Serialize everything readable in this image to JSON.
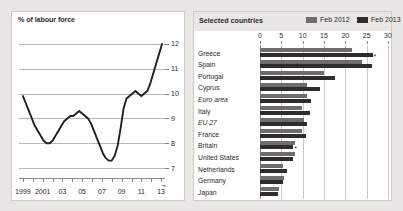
{
  "colors": {
    "background": "#e9e7e3",
    "panel": "#ffffff",
    "line": "#231f20",
    "bar_2012": "#6f6d69",
    "bar_2013": "#2f2d2b",
    "grid": "#b9b7b2",
    "text": "#2b2b2b"
  },
  "left_panel": {
    "title": "% of labour force"
  },
  "right_panel": {
    "title": "Selected countries",
    "legend": [
      {
        "label": "Feb 2012",
        "color": "#6f6d69"
      },
      {
        "label": "Feb 2013",
        "color": "#2f2d2b"
      }
    ]
  },
  "chart_data": [
    {
      "type": "line",
      "title": "% of labour force",
      "xlabel": "",
      "ylabel": "% of labour force",
      "ylim": [
        6.6,
        12.4
      ],
      "xlim": [
        1998.6,
        2013.4
      ],
      "grid": true,
      "legend_position": "none",
      "yticks": [
        7,
        8,
        9,
        10,
        11,
        12
      ],
      "ytick_labels": [
        "7",
        "8",
        "9",
        "10",
        "11",
        "12"
      ],
      "axis_break_symbol": "⌁",
      "xticks": [
        1999,
        2001,
        2003,
        2005,
        2007,
        2009,
        2011,
        2013
      ],
      "xtick_labels": [
        "1999",
        "2001",
        "03",
        "05",
        "07",
        "09",
        "11",
        "13"
      ],
      "xtick_minor": [
        1999,
        2000,
        2001,
        2002,
        2003,
        2004,
        2005,
        2006,
        2007,
        2008,
        2009,
        2010,
        2011,
        2012,
        2013
      ],
      "series": [
        {
          "name": "Euro-area unemployment rate",
          "x": [
            1999.0,
            1999.3,
            1999.6,
            1999.9,
            2000.2,
            2000.5,
            2000.8,
            2001.1,
            2001.4,
            2001.7,
            2002.0,
            2002.3,
            2002.6,
            2002.9,
            2003.2,
            2003.5,
            2003.8,
            2004.1,
            2004.4,
            2004.7,
            2005.0,
            2005.3,
            2005.6,
            2005.9,
            2006.2,
            2006.5,
            2006.8,
            2007.1,
            2007.4,
            2007.7,
            2008.0,
            2008.3,
            2008.6,
            2008.9,
            2009.2,
            2009.5,
            2009.8,
            2010.1,
            2010.4,
            2010.7,
            2011.0,
            2011.3,
            2011.6,
            2011.9,
            2012.2,
            2012.5,
            2012.8,
            2013.1
          ],
          "y": [
            9.9,
            9.6,
            9.3,
            9.0,
            8.7,
            8.5,
            8.3,
            8.1,
            8.0,
            8.0,
            8.1,
            8.3,
            8.5,
            8.7,
            8.9,
            9.0,
            9.1,
            9.1,
            9.2,
            9.3,
            9.2,
            9.1,
            9.0,
            8.8,
            8.5,
            8.2,
            7.9,
            7.6,
            7.4,
            7.3,
            7.3,
            7.5,
            7.9,
            8.6,
            9.4,
            9.8,
            9.9,
            10.0,
            10.1,
            10.0,
            9.9,
            10.0,
            10.1,
            10.4,
            10.8,
            11.2,
            11.6,
            12.0
          ]
        }
      ]
    },
    {
      "type": "bar",
      "orientation": "horizontal",
      "title": "Selected countries",
      "xlabel": "",
      "ylabel": "",
      "xlim": [
        0,
        30
      ],
      "xticks": [
        0,
        5,
        10,
        15,
        20,
        25,
        30
      ],
      "xtick_labels": [
        "0",
        "5",
        "10",
        "15",
        "20",
        "25",
        "30"
      ],
      "grid": true,
      "legend_position": "top-right",
      "categories": [
        "Greece",
        "Spain",
        "Portugal",
        "Cyprus",
        "Euro area",
        "Italy",
        "EU 27",
        "France",
        "Britain",
        "United States",
        "Netherlands",
        "Germany",
        "Japan"
      ],
      "categories_italic": [
        "Euro area",
        "EU 27"
      ],
      "series": [
        {
          "name": "Feb 2012",
          "color": "#6f6d69",
          "values": [
            21.6,
            23.9,
            15.1,
            10.9,
            10.9,
            9.9,
            10.2,
            9.9,
            8.2,
            8.3,
            5.3,
            5.6,
            4.5
          ]
        },
        {
          "name": "Feb 2013",
          "color": "#2f2d2b",
          "values": [
            26.4,
            26.3,
            17.5,
            14.0,
            12.0,
            11.6,
            10.9,
            10.8,
            7.8,
            7.7,
            6.2,
            5.4,
            4.3
          ]
        }
      ],
      "annotations": [
        {
          "category": "Greece",
          "series": "Feb 2013",
          "marker": "*"
        },
        {
          "category": "Britain",
          "series": "Feb 2013",
          "marker": "*"
        }
      ]
    }
  ]
}
